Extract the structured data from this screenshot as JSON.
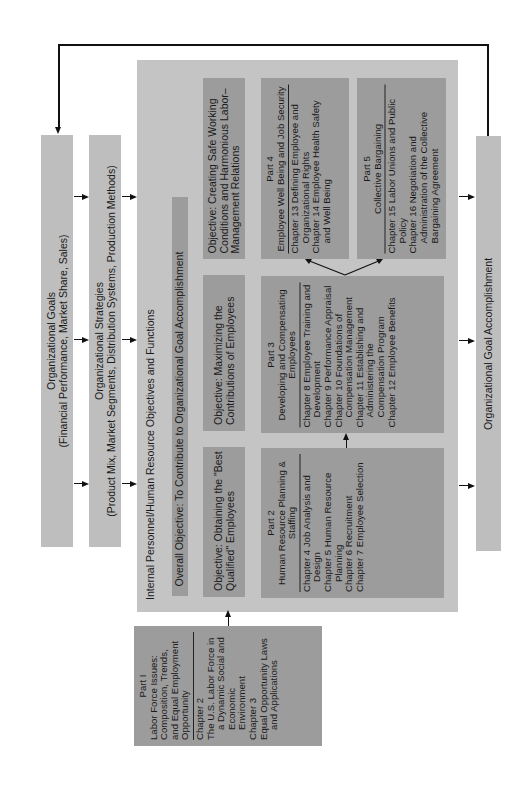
{
  "diagram": {
    "orientation": "rotated-90-ccw",
    "colors": {
      "light_box": "#bebebe",
      "main_panel": "#c4c4c4",
      "dark_box": "#9c9c9c",
      "line": "#111111"
    },
    "org_goals": {
      "title": "Organizational Goals",
      "subtitle": "(Financial Performance, Market Share, Sales)"
    },
    "org_strategies": {
      "title": "Organizational Strategies",
      "subtitle": "(Product Mix, Market Segments, Distribution Systems, Production Methods)"
    },
    "internal_panel": {
      "title": "Internal Personnel/Human Resource Objectives and Functions",
      "overall_objective": "Overall Objective:  To Contribute to Organizational Goal Accomplishment"
    },
    "objectives": [
      {
        "text": "Objective:  Obtaining the \"Best Qualified\" Employees"
      },
      {
        "text": "Objective:  Maximizing the Contributions of Employees"
      },
      {
        "text": "Objective:  Creating Safe Working Conditions and Harmonious Labor–Management Relations"
      }
    ],
    "parts": {
      "part1": {
        "label": "Part I",
        "title": "Labor Force Issues: Composition, Trends, and Equal Employment Opportunity",
        "chapters": [
          "Chapter 2",
          "The U.S. Labor Force in a Dynamic Social and Economic Environment",
          "Chapter 3",
          "Equal Opportunity Laws and Applications"
        ]
      },
      "part2": {
        "label": "Part 2",
        "title": "Human Resource Planning & Staffing",
        "chapters": [
          "Chapter 4 Job Analysis and Design",
          "Chapter 5 Human Resource Planning",
          "Chapter 6 Recruitment",
          "Chapter 7 Employee Selection"
        ]
      },
      "part3": {
        "label": "Part 3",
        "title": "Developing and Compensating Employees",
        "chapters": [
          "Chapter 8 Employee Training and Development",
          "Chapter 9 Performance Appraisal",
          "Chapter 10 Foundations of Compensation Management",
          "Chapter 11 Establishing and Administering the Compensation Program",
          "Chapter 12 Employee Benefits"
        ]
      },
      "part4": {
        "label": "Part 4",
        "title": "Employee Well Being and Job Security",
        "chapters": [
          "Chapter 13 Defining Employee and Organizational Rights",
          "Chapter 14 Employee Health Safety and Well Being"
        ]
      },
      "part5": {
        "label": "Part 5",
        "title": "Collective Bargaining",
        "chapters": [
          "Chapter 15 Labor Unions and Public Policy",
          "Chapter 16 Negotiation and Administration of the Collective Bargaining Agreement"
        ]
      }
    },
    "goal_accomplishment": {
      "title": "Organizational Goal Accomplishment"
    }
  }
}
